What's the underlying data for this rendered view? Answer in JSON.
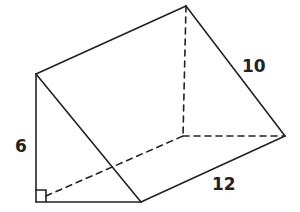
{
  "diagram": {
    "type": "triangular-prism",
    "labels": {
      "height": "6",
      "slant": "10",
      "length": "12"
    },
    "right_angle_marker": true,
    "colors": {
      "stroke": "#222222",
      "background": "#ffffff"
    }
  }
}
